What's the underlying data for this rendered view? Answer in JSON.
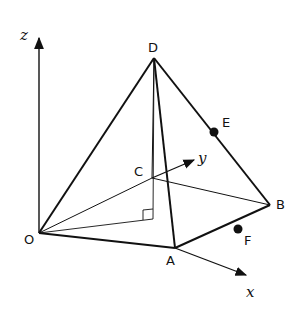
{
  "diagram": {
    "type": "3d-pyramid",
    "colors": {
      "stroke": "#111111",
      "background": "#ffffff"
    },
    "axes": {
      "x": {
        "label": "x"
      },
      "y": {
        "label": "y"
      },
      "z": {
        "label": "z"
      }
    },
    "points": {
      "O": {
        "label": "O"
      },
      "A": {
        "label": "A"
      },
      "B": {
        "label": "B"
      },
      "C": {
        "label": "C"
      },
      "D": {
        "label": "D"
      },
      "E": {
        "label": "E",
        "on_edge": "DB"
      },
      "F": {
        "label": "F",
        "on_edge": "AB"
      }
    },
    "edges": [
      "OA",
      "AB",
      "BC",
      "CO",
      "OD",
      "AD",
      "BD",
      "CD"
    ],
    "auxiliary": [
      "altitude from D to base",
      "line from O to foot of altitude",
      "right-angle marker at foot"
    ]
  }
}
